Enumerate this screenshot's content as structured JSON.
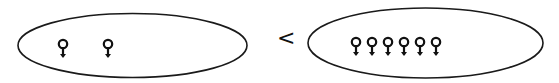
{
  "diagram": {
    "left_group": {
      "count": 2,
      "symbol": "female-sign-icon",
      "positions_x": [
        63,
        108
      ]
    },
    "comparator": "<",
    "right_group": {
      "count": 6,
      "symbol": "female-sign-icon",
      "positions_x": [
        356,
        372,
        388,
        404,
        420,
        436
      ]
    },
    "colors": {
      "stroke": "#111111",
      "background": "#ffffff"
    }
  }
}
